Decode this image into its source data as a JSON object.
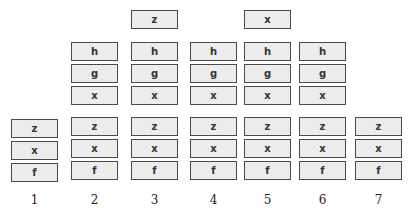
{
  "diagram": {
    "columns": [
      {
        "label": "1",
        "top": [],
        "bottom": [
          "z",
          "x",
          "f"
        ]
      },
      {
        "label": "2",
        "top": [
          "h",
          "g",
          "x"
        ],
        "bottom": [
          "z",
          "x",
          "f"
        ]
      },
      {
        "label": "3",
        "extra": "z",
        "top": [
          "h",
          "g",
          "x"
        ],
        "bottom": [
          "z",
          "x",
          "f"
        ]
      },
      {
        "label": "4",
        "top": [
          "h",
          "g",
          "x"
        ],
        "bottom": [
          "z",
          "x",
          "f"
        ]
      },
      {
        "label": "5",
        "extra": "x",
        "top": [
          "h",
          "g",
          "x"
        ],
        "bottom": [
          "z",
          "x",
          "f"
        ]
      },
      {
        "label": "6",
        "top": [
          "h",
          "g",
          "x"
        ],
        "bottom": [
          "z",
          "x",
          "f"
        ]
      },
      {
        "label": "7",
        "top": [],
        "bottom": [
          "z",
          "x",
          "f"
        ]
      }
    ],
    "colors": {
      "box_fill": "#ececec",
      "box_border": "#4a4a4a",
      "text": "#333333"
    }
  }
}
